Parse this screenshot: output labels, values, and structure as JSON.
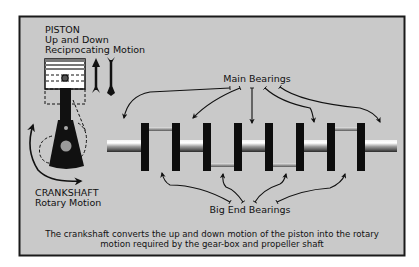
{
  "colors": {
    "page_bg": "#ffffff",
    "panel_bg": "#c9c9c9",
    "frame": "#1a1a1a",
    "ink": "#111111",
    "bearing_pin": "#8a8a8a"
  },
  "piston": {
    "title": "PISTON",
    "line2": "Up and Down",
    "line3": "Reciprocating Motion"
  },
  "crankshaft": {
    "title": "CRANKSHAFT",
    "line2": "Rotary Motion"
  },
  "labels": {
    "main_bearings": "Main Bearings",
    "big_end_bearings": "Big End Bearings"
  },
  "caption": {
    "line1": "The crankshaft converts the up and down motion of the piston into the rotary",
    "line2": "motion required by the gear-box and propeller shaft"
  },
  "icons": {
    "up_down_arrows": "up-down-arrow-icon",
    "rotation_arrow": "rotation-arrow-icon"
  }
}
